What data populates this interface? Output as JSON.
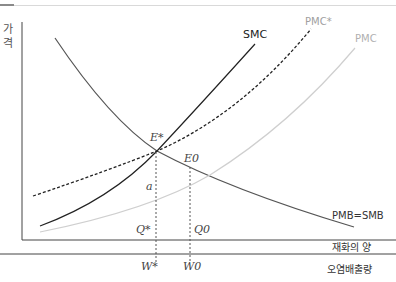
{
  "header": {
    "title_partial": ""
  },
  "axes": {
    "y_label": [
      "가",
      "격"
    ],
    "x_label_goods": "재화의 양",
    "x_label_pollution": "오염배출량"
  },
  "curves": {
    "smc": "SMC",
    "pmc_star": "PMC*",
    "pmc": "PMC",
    "pmb": "PMB=SMB"
  },
  "points": {
    "e_star": "E*",
    "e_zero": "E0",
    "a": "a",
    "q_star": "Q*",
    "q_zero": "Q0",
    "w_star": "W*",
    "w_zero": "W0"
  },
  "colors": {
    "axis": "#333333",
    "smc": "#222222",
    "pmc": "#cccccc",
    "pmb": "#555555",
    "label_gray": "#9a9a9a"
  }
}
